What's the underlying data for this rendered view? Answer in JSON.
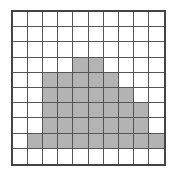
{
  "diagram": {
    "type": "grid",
    "rows": 10,
    "cols": 10,
    "colors": {
      "shaded": "#b3b3b3",
      "empty": "#ffffff",
      "line": "#555555"
    },
    "shaded_cells_by_row": [
      [],
      [],
      [],
      [
        4,
        5
      ],
      [
        2,
        3,
        4,
        5,
        6
      ],
      [
        2,
        3,
        4,
        5,
        6,
        7
      ],
      [
        2,
        3,
        4,
        5,
        6,
        7,
        8
      ],
      [
        2,
        3,
        4,
        5,
        6,
        7,
        8
      ],
      [
        1,
        2,
        3,
        4,
        5,
        6,
        7,
        8,
        9
      ],
      []
    ],
    "shaded_count": 35
  }
}
